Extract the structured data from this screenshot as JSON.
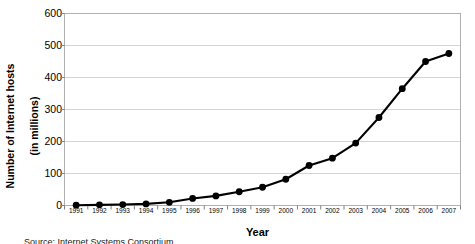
{
  "chart_data": {
    "type": "line",
    "title": "",
    "xlabel": "Year",
    "ylabel": "Number of Internet hosts (in millions)",
    "ylabel_line1": "Number of Internet hosts",
    "ylabel_line2": "(in millions)",
    "categories": [
      "1991",
      "1992",
      "1993",
      "1994",
      "1995",
      "1996",
      "1997",
      "1998",
      "1999",
      "2000",
      "2001",
      "2002",
      "2003",
      "2004",
      "2005",
      "2006",
      "2007"
    ],
    "values": [
      1,
      2,
      3,
      5,
      10,
      22,
      30,
      43,
      57,
      82,
      125,
      148,
      195,
      275,
      365,
      450,
      475
    ],
    "ylim": [
      0,
      600
    ],
    "yticks": [
      0,
      100,
      200,
      300,
      400,
      500,
      600
    ],
    "ytick_labels": [
      "0",
      "100",
      "200",
      "300",
      "400",
      "500",
      "600"
    ],
    "grid": true,
    "grid_axis": "y",
    "legend": "none",
    "marker": "filled-circle",
    "line_color": "#000000",
    "marker_color": "#000000",
    "grid_color": "#d4d4d4",
    "axis_color": "#808080",
    "plot_background": "#ffffff"
  },
  "caption": {
    "source": "Source: Internet Systems Consortium"
  }
}
